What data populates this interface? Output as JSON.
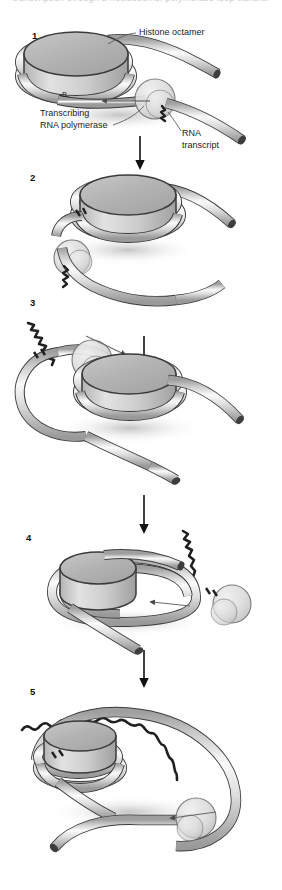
{
  "figure": {
    "title_clipped": "transcription through a nucleosome: polymerase loop transfer",
    "steps": [
      {
        "number": "1",
        "x": 32,
        "y": 30
      },
      {
        "number": "2",
        "x": 30,
        "y": 172
      },
      {
        "number": "3",
        "x": 30,
        "y": 297
      },
      {
        "number": "4",
        "x": 26,
        "y": 532
      },
      {
        "number": "5",
        "x": 30,
        "y": 686
      }
    ],
    "labels": {
      "histone_octamer": "Histone octamer",
      "transcribing": "Transcribing",
      "rna_polymerase": "RNA polymerase",
      "rna": "RNA",
      "transcript": "transcript",
      "b_marker": "B"
    },
    "colors": {
      "dna_fill": "#d8d8d8",
      "dna_highlight": "#f3f3f3",
      "dna_shadow": "#a9a9a9",
      "octamer_top": "#b8b8b8",
      "octamer_side": "#cfcfcf",
      "polymerase": "#dcdcdc",
      "outline": "#3a3a3a",
      "rna_strand": "#2b2b2b",
      "arrow": "#111111",
      "text": "#1c1c1c",
      "background": "#ffffff"
    },
    "flow_arrows": [
      {
        "from_step": "1",
        "to_step": "2",
        "x": 140,
        "y1": 133,
        "y2": 168
      },
      {
        "from_step": "2",
        "to_step": "3",
        "x": 140,
        "y1": 268,
        "y2": 298
      },
      {
        "from_step": "3",
        "to_step": "4",
        "x": 144,
        "y1": 333,
        "y2": 368
      },
      {
        "from_step": "4",
        "to_step": "5",
        "x": 144,
        "y1": 492,
        "y2": 528
      },
      {
        "from_step": "5",
        "to_step": "end",
        "x": 144,
        "y1": 646,
        "y2": 682
      }
    ]
  }
}
